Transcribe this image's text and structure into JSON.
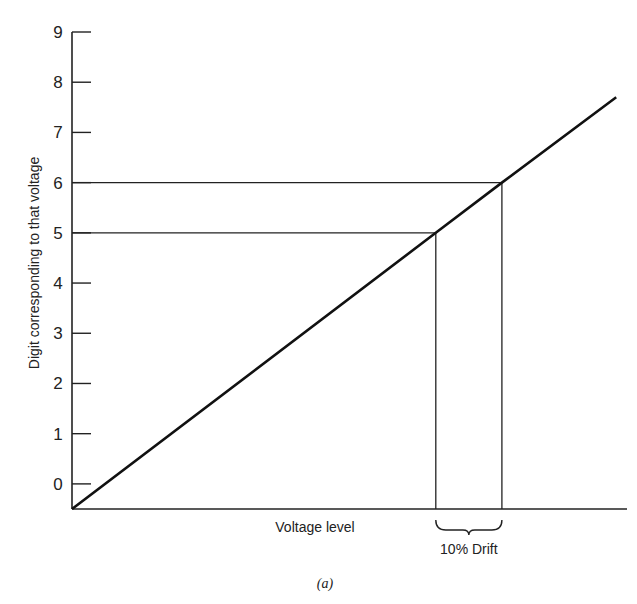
{
  "chart_data": {
    "type": "line",
    "title": "",
    "caption": "(a)",
    "xlabel": "Voltage level",
    "ylabel": "Digit corresponding to that voltage",
    "ylim": [
      -0.5,
      9
    ],
    "yticks": [
      "0",
      "1",
      "2",
      "3",
      "4",
      "5",
      "6",
      "7",
      "8",
      "9"
    ],
    "grid": false,
    "series": [
      {
        "name": "transfer line",
        "points": [
          {
            "digit": -0.5,
            "voltage_fraction": 0.0
          },
          {
            "digit": 5,
            "voltage_fraction": 0.6555
          },
          {
            "digit": 6,
            "voltage_fraction": 0.7746
          },
          {
            "digit": 7.7,
            "voltage_fraction": 0.9805
          }
        ]
      }
    ],
    "guides": [
      {
        "digit": 5,
        "label": "level 5"
      },
      {
        "digit": 6,
        "label": "level 6"
      }
    ],
    "annotation": {
      "text": "10% Drift",
      "from_digit": 5,
      "to_digit": 6
    }
  }
}
